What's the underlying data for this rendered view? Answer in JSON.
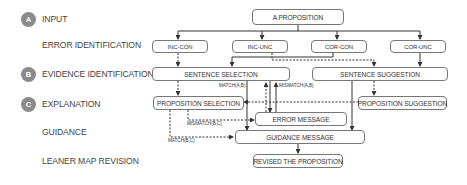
{
  "rows": {
    "input": {
      "badge": "A",
      "label": "INPUT"
    },
    "error_identification": {
      "label": "ERROR IDENTIFICATION"
    },
    "evidence_identification": {
      "badge": "B",
      "label": "EVIDENCE IDENTIFICATION"
    },
    "explanation": {
      "badge": "C",
      "label": "EXPLANATION"
    },
    "guidance": {
      "label": "GUIDANCE"
    },
    "map_revision": {
      "label": "LEANER MAP REVISION"
    }
  },
  "nodes": {
    "proposition": "A PROPOSITION",
    "inc_con": "INC-CON",
    "inc_unc": "INC-UNC",
    "cor_con": "COR-CON",
    "cor_unc": "COR-UNC",
    "sentence_selection": "SENTENCE SELECTION",
    "sentence_suggestion": "SENTENCE SUGGESTION",
    "proposition_selection": "PROPOSITION SELECTION",
    "proposition_suggestion": "PROPOSITION SUGGESTION",
    "error_message": "ERROR MESSAGE",
    "guidance_message": "GUIDANCE MESSAGE",
    "revised_proposition": "REVISED THE PROPOSITION"
  },
  "edge_labels": {
    "match_ab": "MATCH(A,B)",
    "mismatch_ab": "MISMATCH(A,B)",
    "mismatch_bc": "MISMATCH(B,C)",
    "match_bc": "MATCH(B,C)"
  },
  "colors": {
    "badge": "#8a8a8a",
    "line": "#333333",
    "box_border": "#777777"
  }
}
